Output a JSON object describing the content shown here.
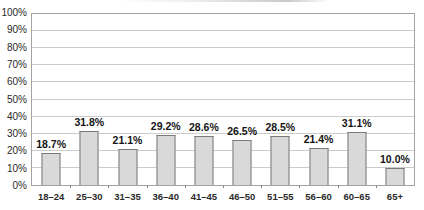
{
  "chart_data": {
    "type": "bar",
    "title": "",
    "title_note": "title cropped out of frame at top of screenshot",
    "categories": [
      "18–24",
      "25–30",
      "31–35",
      "36–40",
      "41–45",
      "46–50",
      "51–55",
      "56–60",
      "60–65",
      "65+"
    ],
    "values": [
      18.7,
      31.8,
      21.1,
      29.2,
      28.6,
      26.5,
      28.5,
      21.4,
      31.1,
      10.0
    ],
    "value_labels": [
      "18.7%",
      "31.8%",
      "21.1%",
      "29.2%",
      "28.6%",
      "26.5%",
      "28.5%",
      "21.4%",
      "31.1%",
      "10.0%"
    ],
    "xlabel": "",
    "ylabel": "",
    "y_ticks": [
      "0%",
      "10%",
      "20%",
      "30%",
      "40%",
      "50%",
      "60%",
      "70%",
      "80%",
      "90%",
      "100%"
    ],
    "ylim": [
      0,
      100
    ],
    "grid": true,
    "legend": "none",
    "colors": {
      "bar_fill": "#d9d9d9",
      "bar_border": "#7a7a7a",
      "gridline": "#cbcbcb",
      "plot_border": "#a3a3a3",
      "label_text": "#141414",
      "axis_text": "#2a2a2a",
      "background": "#ffffff"
    }
  }
}
